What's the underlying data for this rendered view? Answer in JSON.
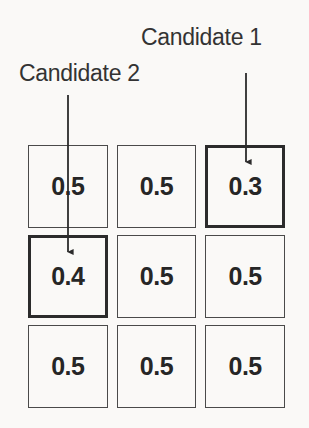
{
  "diagram": {
    "background_color": "#faf9f7",
    "line_color": "#2b2b2b",
    "text_color": "#333333",
    "value_color": "#262626"
  },
  "labels": {
    "candidate_1": "Candidate 1",
    "candidate_2": "Candidate 2"
  },
  "arrows": [
    {
      "name": "candidate-1-arrow",
      "points_to": "cell-r0-c2",
      "x": 246,
      "y_start": 73,
      "y_end": 168
    },
    {
      "name": "candidate-2-arrow",
      "points_to": "cell-r1-c0",
      "x": 68,
      "y_start": 95,
      "y_end": 258
    }
  ],
  "grid": {
    "rows": 3,
    "columns": 3,
    "cells": [
      {
        "value": "0.5",
        "highlighted": false
      },
      {
        "value": "0.5",
        "highlighted": false
      },
      {
        "value": "0.3",
        "highlighted": true
      },
      {
        "value": "0.4",
        "highlighted": true
      },
      {
        "value": "0.5",
        "highlighted": false
      },
      {
        "value": "0.5",
        "highlighted": false
      },
      {
        "value": "0.5",
        "highlighted": false
      },
      {
        "value": "0.5",
        "highlighted": false
      },
      {
        "value": "0.5",
        "highlighted": false
      }
    ]
  }
}
